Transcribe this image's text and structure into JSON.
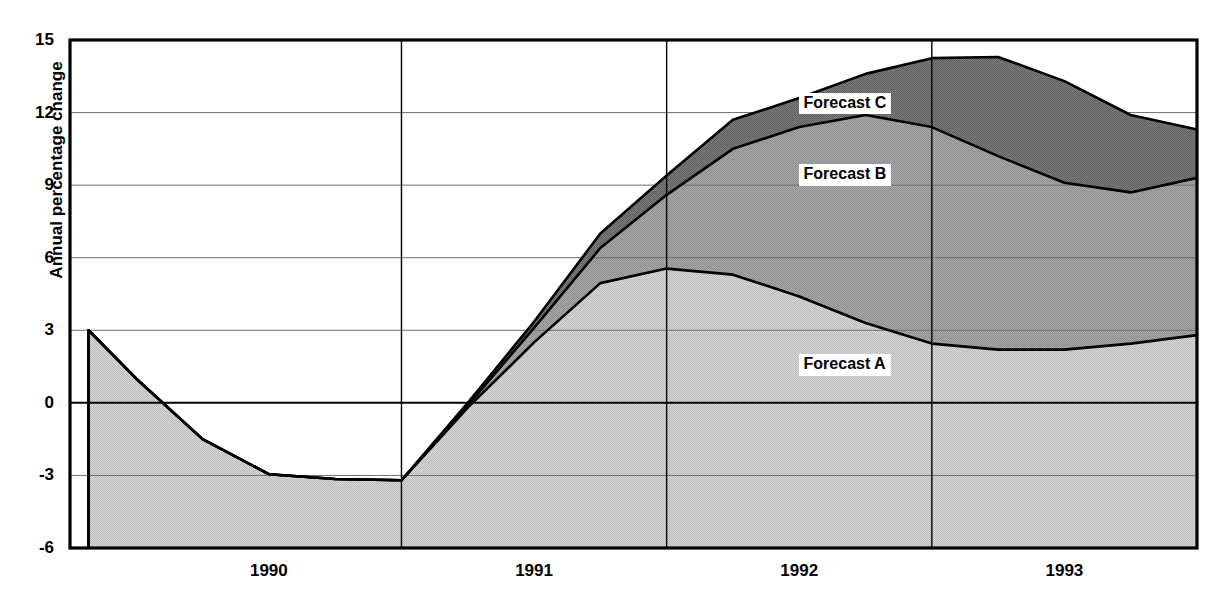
{
  "chart_data": {
    "type": "area",
    "title": "",
    "xlabel": "",
    "ylabel": "Annual percentage change",
    "ylim": [
      -6,
      15
    ],
    "yticks": [
      15,
      12,
      9,
      6,
      3,
      0,
      -3,
      -6
    ],
    "xticks": [
      "1990",
      "1991",
      "1992",
      "1993"
    ],
    "xlim": [
      1989.75,
      1994.0
    ],
    "grid": true,
    "zero_line": true,
    "legend_position": "inline-right",
    "stacking": "overlaid-bands",
    "x": [
      1989.82,
      1990.0,
      1990.25,
      1990.5,
      1990.75,
      1991.0,
      1991.25,
      1991.5,
      1991.75,
      1992.0,
      1992.25,
      1992.5,
      1992.75,
      1993.0,
      1993.25,
      1993.5,
      1993.75,
      1994.0
    ],
    "series": [
      {
        "name": "Forecast A",
        "fill": "#cbcbcb",
        "values": [
          3.0,
          1.0,
          -1.5,
          -2.95,
          -3.15,
          -3.2,
          -0.2,
          2.5,
          4.95,
          5.55,
          5.3,
          4.4,
          3.3,
          2.45,
          2.2,
          2.2,
          2.45,
          2.8
        ]
      },
      {
        "name": "Forecast B",
        "fill": "#9d9d9d",
        "values": [
          3.0,
          1.0,
          -1.5,
          -2.95,
          -3.15,
          -3.2,
          -0.1,
          3.1,
          6.4,
          8.6,
          10.5,
          11.4,
          11.9,
          11.4,
          10.2,
          9.1,
          8.7,
          9.3
        ]
      },
      {
        "name": "Forecast C",
        "fill": "#6e6e6e",
        "values": [
          3.0,
          1.0,
          -1.5,
          -2.95,
          -3.15,
          -3.2,
          0.0,
          3.35,
          7.0,
          9.4,
          11.7,
          12.6,
          13.6,
          14.25,
          14.3,
          13.3,
          11.9,
          11.3
        ]
      }
    ],
    "annotations": [
      {
        "text": "Forecast C",
        "x": 1992.95,
        "y": 12.35
      },
      {
        "text": "Forecast B",
        "x": 1992.95,
        "y": 9.4
      },
      {
        "text": "Forecast A",
        "x": 1992.95,
        "y": 1.55
      }
    ]
  },
  "axis": {
    "y_title": "Annual percentage change",
    "y_ticks": [
      "15",
      "12",
      "9",
      "6",
      "3",
      "0",
      "-3",
      "-6"
    ],
    "x_ticks": [
      "1990",
      "1991",
      "1992",
      "1993"
    ]
  },
  "legend": {
    "forecast_a": "Forecast A",
    "forecast_b": "Forecast B",
    "forecast_c": "Forecast C"
  },
  "header": {
    "cropped_title": ""
  },
  "colors": {
    "band_a": "#cbcbcb",
    "band_b": "#9d9d9d",
    "band_c": "#6e6e6e",
    "line": "#000000",
    "grid": "#808080",
    "axis": "#000000",
    "background": "#ffffff"
  }
}
